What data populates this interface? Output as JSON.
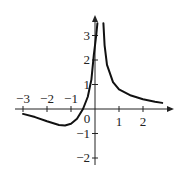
{
  "chart_data": {
    "type": "line",
    "title": "",
    "xlabel": "",
    "ylabel": "",
    "xlim": [
      -3.1,
      3.0
    ],
    "ylim": [
      -2.2,
      3.8
    ],
    "grid": false,
    "x_ticks": [
      "-3",
      "-2",
      "-1",
      "0",
      "1",
      "2"
    ],
    "y_ticks": [
      "-2",
      "-1",
      "1",
      "2",
      "3"
    ],
    "vertical_asymptote": 0.25,
    "series": [
      {
        "name": "left branch",
        "points": [
          [
            -3.0,
            -0.2
          ],
          [
            -2.5,
            -0.33
          ],
          [
            -2.0,
            -0.5
          ],
          [
            -1.5,
            -0.65
          ],
          [
            -1.25,
            -0.67
          ],
          [
            -1.0,
            -0.6
          ],
          [
            -0.75,
            -0.4
          ],
          [
            -0.5,
            0.0
          ],
          [
            -0.3,
            0.5
          ],
          [
            -0.15,
            1.2
          ],
          [
            -0.05,
            2.2
          ],
          [
            0.05,
            3.0
          ],
          [
            0.1,
            3.5
          ]
        ]
      },
      {
        "name": "right branch",
        "points": [
          [
            0.35,
            3.5
          ],
          [
            0.4,
            2.6
          ],
          [
            0.5,
            1.8
          ],
          [
            0.75,
            1.1
          ],
          [
            1.0,
            0.8
          ],
          [
            1.5,
            0.55
          ],
          [
            2.0,
            0.4
          ],
          [
            2.5,
            0.3
          ],
          [
            2.8,
            0.25
          ]
        ]
      }
    ]
  }
}
